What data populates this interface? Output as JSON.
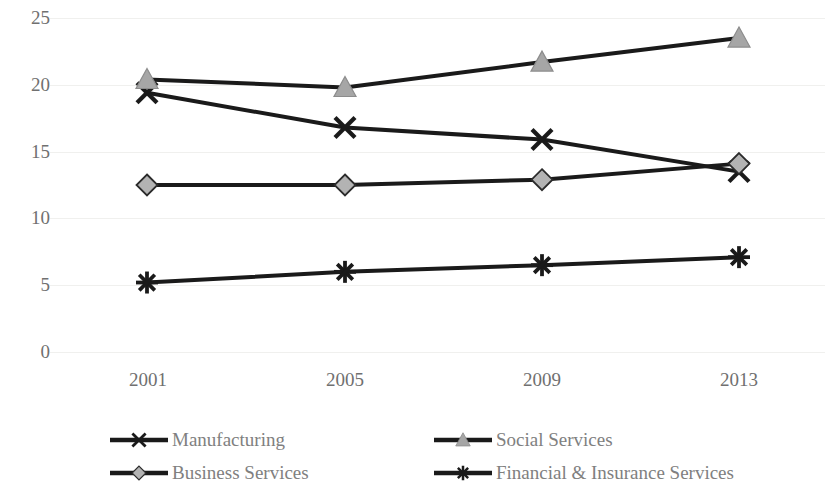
{
  "chart_data": {
    "type": "line",
    "title": "",
    "subtitle": "",
    "xlabel": "",
    "ylabel": "",
    "categories": [
      "2001",
      "2005",
      "2009",
      "2013"
    ],
    "x_tick_labels": [
      "2001",
      "2005",
      "2009",
      "2013"
    ],
    "y_tick_labels": [
      "25",
      "20",
      "15",
      "10",
      "5",
      "0"
    ],
    "ylim": [
      0,
      25
    ],
    "y_ticks": [
      0,
      5,
      10,
      15,
      20,
      25
    ],
    "grid": "horizontal",
    "legend_position": "bottom",
    "series": [
      {
        "name": "Manufacturing",
        "marker": "x-cross",
        "color": "#1a1a1a",
        "values": [
          19.4,
          16.8,
          15.9,
          13.5
        ]
      },
      {
        "name": "Social Services",
        "marker": "triangle",
        "color": "#1a1a1a",
        "marker_fill": "#a6a6a6",
        "values": [
          20.4,
          19.8,
          21.7,
          23.5
        ]
      },
      {
        "name": "Business Services",
        "marker": "diamond",
        "color": "#1a1a1a",
        "marker_fill": "#b3b3b3",
        "values": [
          12.5,
          12.5,
          12.9,
          14.1
        ]
      },
      {
        "name": "Financial & Insurance Services",
        "marker": "asterisk",
        "color": "#1a1a1a",
        "values": [
          5.2,
          6.0,
          6.5,
          7.1
        ]
      }
    ]
  },
  "legend": {
    "items": [
      {
        "label": "Manufacturing",
        "marker": "x-cross"
      },
      {
        "label": "Social Services",
        "marker": "triangle"
      },
      {
        "label": "Business Services",
        "marker": "diamond"
      },
      {
        "label": "Financial & Insurance Services",
        "marker": "asterisk"
      }
    ]
  },
  "colors": {
    "line": "#1a1a1a",
    "tick_text": "#707070",
    "legend_text": "#808080",
    "gridline": "#f0f0ee",
    "marker_grey": "#a6a6a6",
    "background": "#ffffff"
  }
}
